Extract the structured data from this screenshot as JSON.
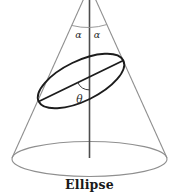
{
  "figure": {
    "caption": "Ellipse",
    "labels": {
      "apex_angle_left": "α",
      "apex_angle_right": "α",
      "section_angle": "θ"
    },
    "colors": {
      "background": "#ffffff",
      "cone_outline": "#8f8f8f",
      "cone_axis": "#4d4d4d",
      "section_ellipse": "#1c1c1c",
      "angle_arc": "#9a9a9a",
      "theta_arc": "#3a3a3a",
      "label_text": "#2b2b2b",
      "caption_text": "#1a1a1a"
    }
  }
}
